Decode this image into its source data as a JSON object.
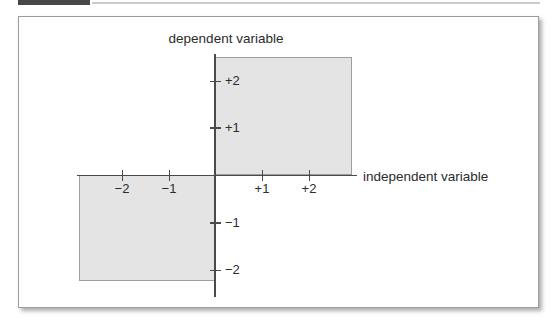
{
  "figure": {
    "y_axis": {
      "label": "dependent variable",
      "ticks": [
        {
          "value": 2,
          "label": "+2"
        },
        {
          "value": 1,
          "label": "+1"
        },
        {
          "value": -1,
          "label": "−1"
        },
        {
          "value": -2,
          "label": "−2"
        }
      ]
    },
    "x_axis": {
      "label": "independent variable",
      "ticks": [
        {
          "value": -2,
          "label": "−2"
        },
        {
          "value": -1,
          "label": "−1"
        },
        {
          "value": 1,
          "label": "+1"
        },
        {
          "value": 2,
          "label": "+2"
        }
      ]
    },
    "shaded_regions": [
      {
        "name": "quadrant-1",
        "x_range": [
          0,
          2.9
        ],
        "y_range": [
          0,
          2.5
        ]
      },
      {
        "name": "quadrant-3",
        "x_range": [
          -2.9,
          0
        ],
        "y_range": [
          -2.3,
          0
        ]
      }
    ],
    "colors": {
      "region_fill": "#e4e4e4",
      "region_border": "#9e9e9e",
      "axis_line": "#4a4a4a",
      "text": "#2b2b2b",
      "panel_border": "#9b9b9b",
      "header_bar": "#474747",
      "header_rule": "#cbcbcb"
    }
  }
}
